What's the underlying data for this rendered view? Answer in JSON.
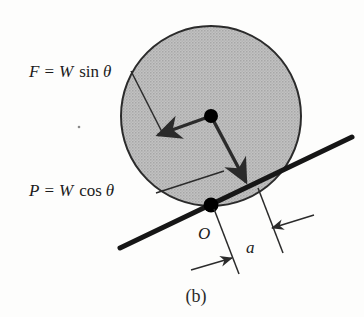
{
  "figure": {
    "caption": "(b)",
    "labels": {
      "force_friction": {
        "lhs": "F",
        "equals": "=",
        "weight": "W",
        "trig": "sin",
        "angle": "θ",
        "full": "F = W sin θ"
      },
      "force_normal": {
        "lhs": "P",
        "equals": "=",
        "weight": "W",
        "trig": "cos",
        "angle": "θ",
        "full": "P = W cos θ"
      },
      "contact_point": "O",
      "dimension": "a"
    },
    "colors": {
      "disk_fill": "#b8b8b8",
      "disk_stroke": "#2b2b2b",
      "incline_stroke": "#161616",
      "arrow_stroke": "#2b2b2b",
      "dot_fill": "#000000",
      "leader_stroke": "#2b2b2b",
      "dimension_stroke": "#2b2b2b",
      "text": "#1b1b1b",
      "background": "#fdfdfc"
    },
    "geometry": {
      "disk_center_x": 211,
      "disk_center_y": 116,
      "disk_radius": 90,
      "contact_x": 211,
      "contact_y": 205,
      "incline_x1": 120,
      "incline_y1": 248,
      "incline_x2": 352,
      "incline_y2": 137,
      "incline_angle_deg": 25.6
    }
  }
}
